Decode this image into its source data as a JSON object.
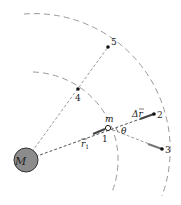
{
  "diagram": {
    "mass_label": "M",
    "particle_label": "m",
    "points": [
      {
        "id": "1",
        "label": "1"
      },
      {
        "id": "2",
        "label": "2"
      },
      {
        "id": "3",
        "label": "3"
      },
      {
        "id": "4",
        "label": "4"
      },
      {
        "id": "5",
        "label": "5"
      }
    ],
    "vector_r1": "r",
    "vector_r1_sub": "1",
    "delta_r": "Δr",
    "angle_label": "θ",
    "colors": {
      "dash": "#9a9a9a",
      "mass_fill": "#8c8c8c",
      "mass_stroke": "#333333",
      "arrow": "#444444"
    }
  }
}
